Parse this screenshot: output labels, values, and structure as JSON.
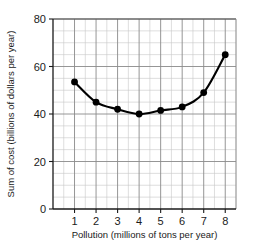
{
  "chart_data": {
    "type": "scatter",
    "title": "",
    "xlabel": "Pollution (millions of tons per year)",
    "ylabel": "Sum of cost (billions of dollars per year)",
    "x": [
      1,
      2,
      3,
      4,
      5,
      6,
      7,
      8
    ],
    "values": [
      53.5,
      45,
      42,
      40,
      41.5,
      43,
      49,
      65
    ],
    "series": [
      {
        "name": "Sum of cost",
        "x": [
          1,
          2,
          3,
          4,
          5,
          6,
          7,
          8
        ],
        "values": [
          53.5,
          45,
          42,
          40,
          41.5,
          43,
          49,
          65
        ]
      }
    ],
    "xlim": [
      0,
      8.5
    ],
    "ylim": [
      0,
      80
    ],
    "xticks": [
      1,
      2,
      3,
      4,
      5,
      6,
      7,
      8
    ],
    "yticks": [
      0,
      20,
      40,
      60,
      80
    ],
    "xtick_labels": [
      "1",
      "2",
      "3",
      "4",
      "5",
      "6",
      "7",
      "8"
    ],
    "ytick_labels": [
      "0",
      "20",
      "40",
      "60",
      "80"
    ],
    "x_minor_step": 0.5,
    "y_minor_step": 5,
    "grid": true,
    "legend": "none",
    "marker": "filled-circle",
    "line_style": "solid-curve",
    "colors": {
      "marker": "#000000",
      "line": "#000000",
      "grid_major": "#8a8a8a",
      "grid_minor": "#c8c8c8",
      "axis": "#1a1a1a",
      "background": "#ffffff"
    }
  }
}
